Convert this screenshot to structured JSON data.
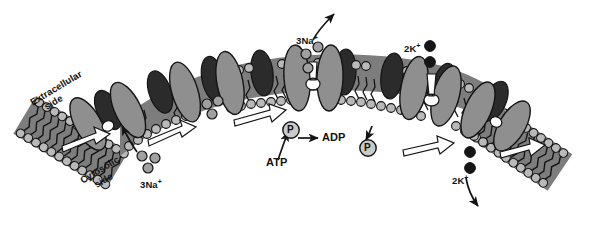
{
  "figure": {
    "background": "#ffffff"
  },
  "palette": {
    "protein_gray": "#8f8f8f",
    "protein_dark": "#2b2b2b",
    "head_light": "#b9b9b9",
    "head_mid": "#9a9a9a",
    "tail_gray": "#7d7d7d",
    "outline": "#1a1a1a",
    "channel_white": "#ffffff",
    "na_ion": "#a0a0a0",
    "k_ion": "#1a1a1a",
    "text": "#111111"
  },
  "labels": {
    "extracellular_line1": "Extracellular",
    "extracellular_line2": "side",
    "cytosolic_line1": "Cytosolic",
    "cytosolic_line2": "side",
    "na_in": "3Na",
    "na_in_charge": "+",
    "na_out": "3Na",
    "na_out_charge": "+",
    "k_in": "2K",
    "k_in_charge": "+",
    "k_out": "2K",
    "k_out_charge": "+",
    "atp": "ATP",
    "adp": "ADP",
    "phosphate_bound": "P",
    "phosphate_released": "P"
  },
  "ions": {
    "sodium_cytosolic_count": 3,
    "sodium_extracellular_count": 3,
    "potassium_extracellular_count": 2,
    "potassium_cytosolic_count": 2
  },
  "steps": [
    {
      "id": 1,
      "name": "na-binding",
      "description": "3Na+ bind from cytosolic side"
    },
    {
      "id": 2,
      "name": "phosphorylation",
      "description": "ATP hydrolyzed to ADP, pump phosphorylated"
    },
    {
      "id": 3,
      "name": "na-release",
      "description": "3Na+ released to extracellular side"
    },
    {
      "id": 4,
      "name": "k-binding",
      "description": "2K+ bind from extracellular side"
    },
    {
      "id": 5,
      "name": "dephosphorylation",
      "description": "Phosphate released, 2K+ released to cytosol"
    }
  ]
}
